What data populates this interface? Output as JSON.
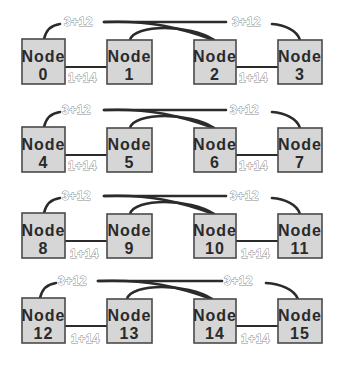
{
  "diagram": {
    "node_prefix": "Node",
    "row_link_label_far": "3+12",
    "row_link_label_near": "1+14",
    "rows": [
      {
        "nodes": [
          {
            "label": "Node",
            "id": "0"
          },
          {
            "label": "Node",
            "id": "1"
          },
          {
            "label": "Node",
            "id": "2"
          },
          {
            "label": "Node",
            "id": "3"
          }
        ],
        "labels": {
          "top_left": "3+12",
          "top_right": "3+12",
          "mid_left": "1+14",
          "mid_right": "1+14"
        }
      },
      {
        "nodes": [
          {
            "label": "Node",
            "id": "4"
          },
          {
            "label": "Node",
            "id": "5"
          },
          {
            "label": "Node",
            "id": "6"
          },
          {
            "label": "Node",
            "id": "7"
          }
        ],
        "labels": {
          "top_left": "3+12",
          "top_right": "3+12",
          "mid_left": "1+14",
          "mid_right": "1+14"
        }
      },
      {
        "nodes": [
          {
            "label": "Node",
            "id": "8"
          },
          {
            "label": "Node",
            "id": "9"
          },
          {
            "label": "Node",
            "id": "10"
          },
          {
            "label": "Node",
            "id": "11"
          }
        ],
        "labels": {
          "top_left": "3+12",
          "top_right": "3+12",
          "mid_left": "1+14",
          "mid_right": "1+14"
        }
      },
      {
        "nodes": [
          {
            "label": "Node",
            "id": "12"
          },
          {
            "label": "Node",
            "id": "13"
          },
          {
            "label": "Node",
            "id": "14"
          },
          {
            "label": "Node",
            "id": "15"
          }
        ],
        "labels": {
          "top_left": "3+12",
          "top_right": "3+12",
          "mid_left": "1+14",
          "mid_right": "1+14"
        }
      }
    ],
    "colors": {
      "node_fill": "#d6d6d6",
      "node_border": "#4a4a4a",
      "wire": "#2b2b2b",
      "label_outline": "#8a8a8a"
    }
  }
}
